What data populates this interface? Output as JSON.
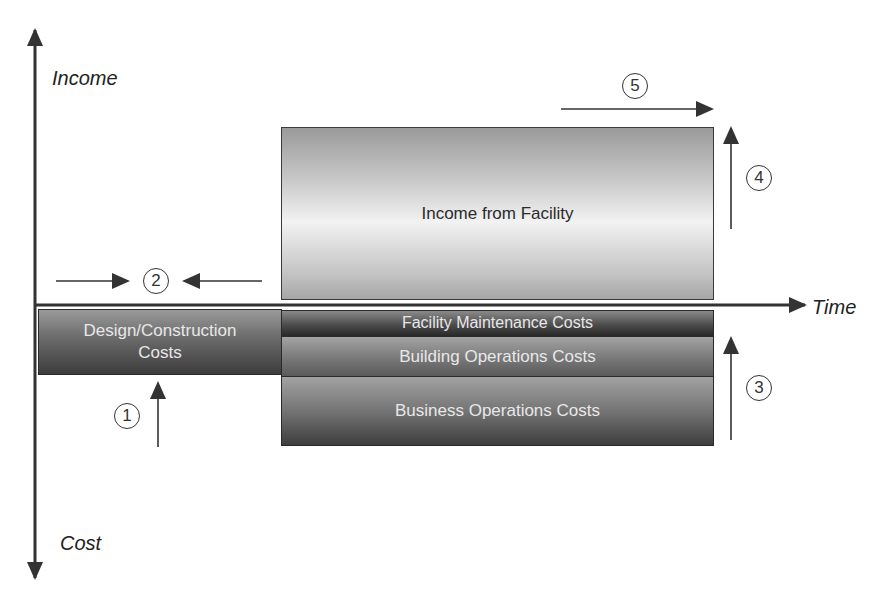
{
  "diagram": {
    "axes": {
      "y_positive_label": "Income",
      "y_negative_label": "Cost",
      "x_label": "Time"
    },
    "boxes": {
      "income": "Income from Facility",
      "design_construction_line1": "Design/Construction",
      "design_construction_line2": "Costs",
      "facility_maintenance": "Facility Maintenance Costs",
      "building_operations": "Building Operations Costs",
      "business_operations": "Business Operations Costs"
    },
    "markers": [
      {
        "id": "1",
        "label": "1"
      },
      {
        "id": "2",
        "label": "2"
      },
      {
        "id": "3",
        "label": "3"
      },
      {
        "id": "4",
        "label": "4"
      },
      {
        "id": "5",
        "label": "5"
      }
    ],
    "colors": {
      "axis": "#333333",
      "text_dark": "#2a2a2a",
      "text_light": "#e8e8e8"
    }
  }
}
